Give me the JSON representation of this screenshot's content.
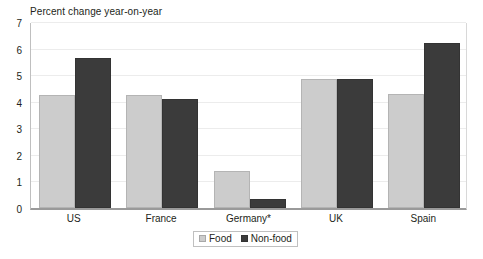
{
  "chart_data": {
    "type": "bar",
    "title": "Percent change year-on-year",
    "subtitle": "",
    "xlabel": "",
    "ylabel": "",
    "categories": [
      "US",
      "France",
      "Germany*",
      "UK",
      "Spain"
    ],
    "series": [
      {
        "name": "Food",
        "color": "#cccccc",
        "values": [
          4.25,
          4.25,
          1.4,
          4.85,
          4.3
        ]
      },
      {
        "name": "Non-food",
        "color": "#3b3b3b",
        "values": [
          5.65,
          4.1,
          0.35,
          4.85,
          6.2
        ]
      }
    ],
    "ylim": [
      0,
      7
    ],
    "yticks": [
      0,
      1,
      2,
      3,
      4,
      5,
      6,
      7
    ],
    "ytick_labels": [
      "0",
      "1",
      "2",
      "3",
      "4",
      "5",
      "6",
      "7"
    ],
    "grid": true,
    "grid_axis": "y",
    "legend_position": "bottom-center",
    "legend_entries": [
      "Food",
      "Non-food"
    ],
    "annotations": []
  },
  "legend": {
    "items": [
      {
        "label": "Food",
        "swatch": "food-swatch-icon"
      },
      {
        "label": "Non-food",
        "swatch": "nonfood-swatch-icon"
      }
    ]
  }
}
